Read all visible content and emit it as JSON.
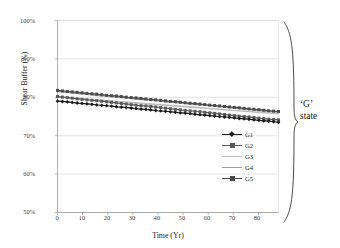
{
  "chart_data": {
    "type": "line",
    "title": "",
    "xlabel": "Time (Yr)",
    "ylabel": "Shear Buffer (%)",
    "xlim": [
      0,
      88
    ],
    "ylim": [
      50,
      100
    ],
    "xticks": [
      "0",
      "10",
      "20",
      "30",
      "40",
      "50",
      "60",
      "70",
      "80"
    ],
    "xtick_values": [
      0,
      10,
      20,
      30,
      40,
      50,
      60,
      70,
      80
    ],
    "yticks": [
      "50%",
      "60%",
      "70%",
      "80%",
      "90%",
      "100%"
    ],
    "ytick_values": [
      50,
      60,
      70,
      80,
      90,
      100
    ],
    "grid": "horizontal",
    "legend_position": "inside-right",
    "x": [
      0,
      4,
      8,
      12,
      16,
      20,
      24,
      28,
      32,
      36,
      40,
      44,
      48,
      52,
      56,
      60,
      64,
      68,
      72,
      76,
      80,
      84,
      88
    ],
    "series": [
      {
        "name": "G1",
        "color": "#1a1a1a",
        "marker": "diamond",
        "values": [
          79.0,
          78.8,
          78.5,
          78.3,
          78.0,
          77.8,
          77.5,
          77.3,
          77.0,
          76.8,
          76.5,
          76.3,
          76.0,
          75.8,
          75.5,
          75.3,
          75.0,
          74.8,
          74.5,
          74.3,
          74.0,
          73.8,
          73.5
        ]
      },
      {
        "name": "G2",
        "color": "#5a5a5a",
        "marker": "square",
        "values": [
          80.2,
          79.9,
          79.6,
          79.3,
          79.1,
          78.8,
          78.5,
          78.2,
          77.9,
          77.7,
          77.4,
          77.1,
          76.8,
          76.5,
          76.3,
          76.0,
          75.7,
          75.4,
          75.1,
          74.9,
          74.6,
          74.3,
          74.1
        ]
      },
      {
        "name": "G3",
        "color": "#bdbdbd",
        "marker": "none",
        "values": [
          80.1,
          79.9,
          79.7,
          79.5,
          79.3,
          79.1,
          78.9,
          78.7,
          78.5,
          78.3,
          78.1,
          77.9,
          77.7,
          77.5,
          77.3,
          77.1,
          76.9,
          76.7,
          76.5,
          76.3,
          76.1,
          75.9,
          75.7
        ]
      },
      {
        "name": "G4",
        "color": "#9e9e9e",
        "marker": "none",
        "values": [
          81.5,
          81.3,
          81.0,
          80.8,
          80.5,
          80.3,
          80.0,
          79.8,
          79.5,
          79.3,
          79.1,
          78.8,
          78.6,
          78.3,
          78.1,
          77.9,
          77.6,
          77.4,
          77.1,
          76.9,
          76.6,
          76.4,
          76.2
        ]
      },
      {
        "name": "G5",
        "color": "#4a4a4a",
        "marker": "square",
        "values": [
          81.8,
          81.5,
          81.3,
          81.0,
          80.8,
          80.5,
          80.3,
          80.0,
          79.8,
          79.5,
          79.3,
          79.0,
          78.8,
          78.5,
          78.3,
          78.0,
          77.8,
          77.5,
          77.3,
          77.0,
          76.8,
          76.5,
          76.3
        ]
      }
    ],
    "annotations": [
      {
        "text_line1": "‘G’",
        "text_line2": "state",
        "type": "brace-label"
      }
    ]
  },
  "annotation": {
    "line1": "‘G’",
    "line2": "state"
  }
}
